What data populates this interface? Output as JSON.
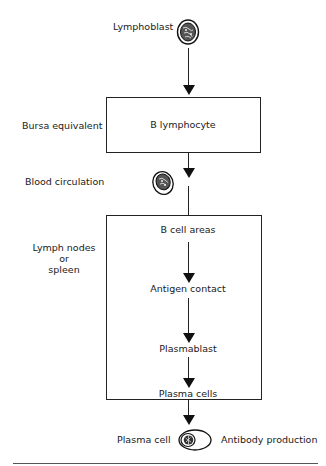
{
  "diagram": {
    "nodes": {
      "lymphoblast": "Lymphoblast",
      "b_lymphocyte": "B lymphocyte",
      "b_cell_areas": "B cell areas",
      "antigen_contact": "Antigen contact",
      "plasmablast": "Plasmablast",
      "plasma_cells": "Plasma cells"
    },
    "side_labels": {
      "bursa": "Bursa equivalent",
      "blood": "Blood circulation",
      "lymph_line1": "Lymph nodes or",
      "lymph_line2": "spleen"
    },
    "bottom": {
      "plasma_cell": "Plasma cell",
      "antibody": "Antibody production"
    },
    "icons": [
      "lymphoblast-cell-icon",
      "circulating-lymphocyte-icon",
      "plasma-cell-icon"
    ],
    "edges": [
      [
        "Lymphoblast",
        "B lymphocyte"
      ],
      [
        "B lymphocyte",
        "Blood circulation"
      ],
      [
        "Blood circulation",
        "B cell areas"
      ],
      [
        "B cell areas",
        "Antigen contact"
      ],
      [
        "Antigen contact",
        "Plasmablast"
      ],
      [
        "Plasmablast",
        "Plasma cells"
      ],
      [
        "Plasma cells",
        "Plasma cell"
      ]
    ]
  }
}
